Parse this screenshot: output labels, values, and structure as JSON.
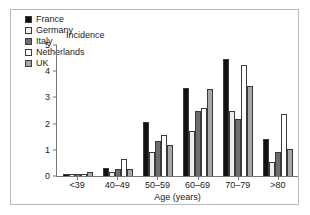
{
  "chart_data": {
    "type": "bar",
    "title": "",
    "subtitle": "",
    "xlabel": "Age (years)",
    "ylabel": "Incidence",
    "categories": [
      "<39",
      "40–49",
      "50–59",
      "60–69",
      "70–79",
      ">80"
    ],
    "ylim": [
      0,
      5
    ],
    "yticks": [
      0,
      1,
      2,
      3,
      4,
      5
    ],
    "ytick_labels": [
      "0",
      "1",
      "2",
      "3",
      "4",
      "5"
    ],
    "grid": false,
    "legend_position": "top-left inside plot",
    "series": [
      {
        "name": "France",
        "fill": "#111111",
        "edge": "#3a3a3a",
        "values": [
          0.05,
          0.3,
          2.05,
          3.35,
          4.48,
          1.43
        ]
      },
      {
        "name": "Germany",
        "fill": "#eeeeee",
        "edge": "#3a3a3a",
        "values": [
          0.05,
          0.15,
          0.93,
          1.7,
          2.47,
          0.55
        ]
      },
      {
        "name": "Italy",
        "fill": "#6e6e6e",
        "edge": "#3a3a3a",
        "values": [
          0.05,
          0.25,
          1.35,
          2.47,
          2.17,
          0.9
        ]
      },
      {
        "name": "Netherlands",
        "fill": "#ffffff",
        "edge": "#3a3a3a",
        "values": [
          0.05,
          0.65,
          1.55,
          2.58,
          4.25,
          2.35
        ]
      },
      {
        "name": "UK",
        "fill": "#a8a8a8",
        "edge": "#3a3a3a",
        "values": [
          0.17,
          0.28,
          1.18,
          3.32,
          3.43,
          1.02
        ]
      }
    ]
  },
  "legend": {
    "items": [
      {
        "label": "France"
      },
      {
        "label": "Germany"
      },
      {
        "label": "Italy"
      },
      {
        "label": "Netherlands"
      },
      {
        "label": "UK"
      }
    ]
  },
  "colors": {
    "frame": "#b9b9b9",
    "axis": "#777777",
    "text": "#1a1a1a",
    "background": "#ffffff"
  }
}
